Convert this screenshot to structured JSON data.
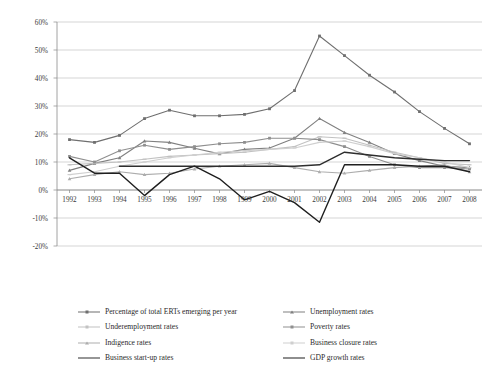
{
  "chart_data": {
    "type": "line",
    "title": "",
    "xlabel": "",
    "ylabel": "",
    "grid": true,
    "legend_position": "bottom",
    "categories": [
      "1992",
      "1993",
      "1994",
      "1995",
      "1996",
      "1997",
      "1998",
      "1999",
      "2000",
      "2001",
      "2002",
      "2003",
      "2004",
      "2005",
      "2006",
      "2007",
      "2008"
    ],
    "x": [
      1992,
      1993,
      1994,
      1995,
      1996,
      1997,
      1998,
      1999,
      2000,
      2001,
      2002,
      2003,
      2004,
      2005,
      2006,
      2007,
      2008
    ],
    "ylim": [
      -20,
      60
    ],
    "yticks": [
      -20,
      -10,
      0,
      10,
      20,
      30,
      40,
      50,
      60
    ],
    "ytick_labels": [
      "-20%",
      "-10%",
      "0%",
      "10%",
      "20%",
      "30%",
      "40%",
      "50%",
      "60%"
    ],
    "series": [
      {
        "name": "Percentage of total ERTs emerging per year",
        "color": "#6f6f6f",
        "width": 1.1,
        "marker": "square",
        "values": [
          18.0,
          17.0,
          19.5,
          25.5,
          28.5,
          26.5,
          26.5,
          27.0,
          29.0,
          35.5,
          55.0,
          48.0,
          41.0,
          35.0,
          28.0,
          22.0,
          16.5
        ]
      },
      {
        "name": "Unemployment rates",
        "color": "#808080",
        "width": 1.1,
        "marker": "triangle",
        "values": [
          7.0,
          9.5,
          11.5,
          17.5,
          17.0,
          14.9,
          12.9,
          14.5,
          15.0,
          18.5,
          25.5,
          20.5,
          17.0,
          13.0,
          10.5,
          8.5,
          8.0
        ]
      },
      {
        "name": "Underemployment rates",
        "color": "#c2c2c2",
        "width": 1.1,
        "marker": "line",
        "values": [
          9.0,
          9.5,
          10.0,
          11.0,
          12.0,
          12.5,
          13.0,
          13.5,
          14.5,
          15.5,
          19.0,
          18.5,
          16.0,
          13.5,
          11.5,
          9.5,
          9.0
        ]
      },
      {
        "name": "Poverty rates",
        "color": "#8f8f8f",
        "width": 1.1,
        "marker": "square",
        "values": [
          12.0,
          10.0,
          14.0,
          16.0,
          14.5,
          15.5,
          16.5,
          17.0,
          18.5,
          18.5,
          18.0,
          15.5,
          12.0,
          9.0,
          8.0,
          8.0,
          7.5
        ]
      },
      {
        "name": "Indigence rates",
        "color": "#adadad",
        "width": 1.1,
        "marker": "triangle",
        "values": [
          4.0,
          5.5,
          6.5,
          5.5,
          6.0,
          7.5,
          8.5,
          9.0,
          9.5,
          8.0,
          6.5,
          6.0,
          7.0,
          8.0,
          8.5,
          9.0,
          6.5
        ]
      },
      {
        "name": "Business closure rates",
        "color": "#cfcfcf",
        "width": 1.1,
        "marker": "line",
        "values": [
          5.5,
          6.5,
          8.5,
          10.0,
          11.5,
          12.5,
          13.5,
          14.0,
          14.5,
          15.0,
          17.0,
          17.5,
          15.5,
          13.0,
          11.5,
          10.0,
          8.0
        ]
      },
      {
        "name": "Business start-up rates",
        "color": "#2e2e2e",
        "width": 1.4,
        "marker": "none",
        "values": [
          null,
          null,
          8.5,
          8.5,
          8.5,
          8.5,
          8.5,
          8.5,
          8.5,
          8.5,
          9.0,
          13.5,
          12.5,
          11.5,
          11.0,
          10.5,
          10.5
        ]
      },
      {
        "name": "GDP growth rates",
        "color": "#1f1f1f",
        "width": 1.4,
        "marker": "none",
        "values": [
          11.5,
          6.0,
          6.0,
          -2.0,
          5.5,
          8.5,
          4.0,
          -3.5,
          -0.5,
          -4.5,
          -11.5,
          9.0,
          9.0,
          9.0,
          8.5,
          8.5,
          6.5
        ]
      }
    ]
  },
  "legend": {
    "items": [
      {
        "label": "Percentage of total ERTs emerging per year",
        "series_index": 0
      },
      {
        "label": "Unemployment rates",
        "series_index": 1
      },
      {
        "label": "Underemployment rates",
        "series_index": 2
      },
      {
        "label": "Poverty rates",
        "series_index": 3
      },
      {
        "label": "Indigence rates",
        "series_index": 4
      },
      {
        "label": "Business closure rates",
        "series_index": 5
      },
      {
        "label": "Business start-up rates",
        "series_index": 6
      },
      {
        "label": "GDP growth rates",
        "series_index": 7
      }
    ]
  }
}
